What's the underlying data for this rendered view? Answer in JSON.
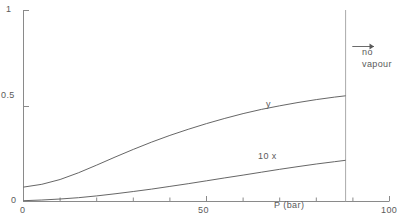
{
  "chart_data": {
    "type": "line",
    "title": "",
    "subtitle": "",
    "xlabel": "P (bar)",
    "xlabel_main": "P",
    "xlabel_sub": "",
    "xlabel_unit": "(bar)",
    "ylabel": "",
    "xlim": [
      0,
      100
    ],
    "ylim": [
      0,
      1
    ],
    "xticks": [
      0,
      50,
      100
    ],
    "xtick_labels": [
      "0",
      "50",
      "100"
    ],
    "xticks_minor": [
      10,
      20,
      30,
      40,
      60,
      70,
      80,
      90
    ],
    "yticks": [
      0,
      0.5,
      1
    ],
    "ytick_labels": [
      "0",
      "0.5",
      "1"
    ],
    "grid": false,
    "legend_position": "inline-labels",
    "line_color": "#555555",
    "axis_color": "#777777",
    "background": "#ffffff",
    "series": [
      {
        "name": "y",
        "label": "y",
        "label_x": 72,
        "label_y": 0.5,
        "x": [
          0,
          5,
          10,
          15,
          20,
          25,
          30,
          35,
          40,
          45,
          50,
          55,
          60,
          65,
          70,
          75,
          80,
          85,
          88
        ],
        "y": [
          0.075,
          0.09,
          0.115,
          0.15,
          0.19,
          0.232,
          0.272,
          0.31,
          0.345,
          0.377,
          0.407,
          0.434,
          0.459,
          0.481,
          0.5,
          0.517,
          0.532,
          0.545,
          0.552
        ]
      },
      {
        "name": "10x",
        "label": "10 x",
        "label_x": 64,
        "label_y": 0.155,
        "x": [
          0,
          5,
          10,
          15,
          20,
          25,
          30,
          35,
          40,
          45,
          50,
          55,
          60,
          65,
          70,
          75,
          80,
          85,
          88
        ],
        "y": [
          0.004,
          0.008,
          0.013,
          0.02,
          0.029,
          0.04,
          0.052,
          0.065,
          0.079,
          0.093,
          0.108,
          0.123,
          0.138,
          0.153,
          0.168,
          0.182,
          0.196,
          0.208,
          0.215
        ]
      }
    ],
    "annotations": [
      {
        "name": "no-vapour",
        "text_line1": "no",
        "text_line2": "vapour",
        "arrow_from_x": 88,
        "arrow_to_x": 96,
        "arrow_y": 0.795
      }
    ],
    "vertical_line": {
      "name": "phase-boundary",
      "x": 88,
      "y_from": 0,
      "y_to": 1
    }
  }
}
